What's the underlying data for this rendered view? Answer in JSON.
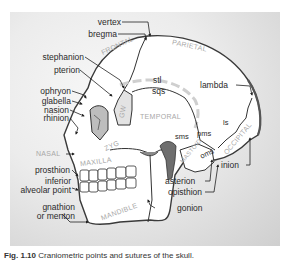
{
  "figure": {
    "landmarks_left": [
      {
        "id": "vertex",
        "label": "vertex"
      },
      {
        "id": "bregma",
        "label": "bregma"
      },
      {
        "id": "stephanion",
        "label": "stephanion"
      },
      {
        "id": "pterion",
        "label": "pterion"
      },
      {
        "id": "ophryon",
        "label": "ophryon"
      },
      {
        "id": "glabella",
        "label": "glabella"
      },
      {
        "id": "nasion",
        "label": "nasion"
      },
      {
        "id": "rhinion",
        "label": "rhinion"
      },
      {
        "id": "prosthion",
        "label": "prosthion"
      },
      {
        "id": "inferior_alveolar_1",
        "label": "inferior"
      },
      {
        "id": "inferior_alveolar_2",
        "label": "alveolar point"
      },
      {
        "id": "gnathion_1",
        "label": "gnathion"
      },
      {
        "id": "gnathion_2",
        "label": "or menton"
      }
    ],
    "landmarks_right": [
      {
        "id": "lambda",
        "label": "lambda"
      },
      {
        "id": "inion",
        "label": "inion"
      },
      {
        "id": "asterion",
        "label": "asterion"
      },
      {
        "id": "opisthion",
        "label": "opisthion"
      },
      {
        "id": "gonion",
        "label": "gonion"
      }
    ],
    "sutures": {
      "stl": "stl",
      "sqs": "sqs",
      "sms": "sms",
      "pms": "pms",
      "oms": "oms",
      "ls": "ls"
    },
    "bones": {
      "frontal": "FRONTAL",
      "parietal": "PARIETAL",
      "temporal": "TEMPORAL",
      "occipital": "OCCIPITAL",
      "mastoid": "MASTOID",
      "sphenoid": "GW",
      "zygomatic": "ZYG",
      "nasal": "NASAL",
      "maxilla": "MAXILLA",
      "mandible": "MANDIBLE"
    },
    "caption": {
      "number": "Fig. 1.10",
      "text": "Craniometric points and sutures of the skull."
    }
  },
  "colors": {
    "bone_fill": "#ffffff",
    "outline": "#3a3a3a",
    "bone_label": "#a8a8a8",
    "label_text": "#2a2a2a",
    "dark_fill": "#6e6e6e",
    "shade_fill": "#d9d9d9"
  }
}
